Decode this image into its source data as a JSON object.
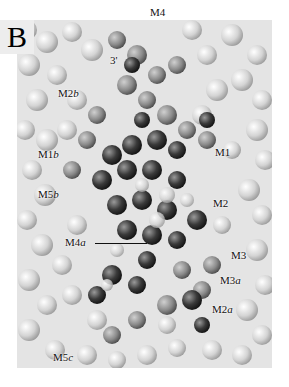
{
  "figure": {
    "panel_letter": "B",
    "colors": {
      "background_atoms": "#d8d8d8",
      "dark_atoms": "#3a3a3a",
      "mid_atoms": "#8a8a8a"
    },
    "labels": [
      {
        "id": "m4",
        "base": "M4",
        "suffix": "",
        "x": 150,
        "y": 6
      },
      {
        "id": "3p",
        "base": "3'",
        "suffix": "",
        "x": 110,
        "y": 54
      },
      {
        "id": "m2b",
        "base": "M2",
        "suffix": "b",
        "x": 58,
        "y": 87
      },
      {
        "id": "m1b",
        "base": "M1",
        "suffix": "b",
        "x": 38,
        "y": 148
      },
      {
        "id": "m1",
        "base": "M1",
        "suffix": "",
        "x": 215,
        "y": 146
      },
      {
        "id": "m5b",
        "base": "M5",
        "suffix": "b",
        "x": 38,
        "y": 188
      },
      {
        "id": "m2",
        "base": "M2",
        "suffix": "",
        "x": 213,
        "y": 197
      },
      {
        "id": "m4a",
        "base": "M4",
        "suffix": "a",
        "x": 65,
        "y": 236
      },
      {
        "id": "m3",
        "base": "M3",
        "suffix": "",
        "x": 231,
        "y": 249
      },
      {
        "id": "m3a",
        "base": "M3",
        "suffix": "a",
        "x": 220,
        "y": 274
      },
      {
        "id": "m2a",
        "base": "M2",
        "suffix": "a",
        "x": 212,
        "y": 303
      },
      {
        "id": "m5c",
        "base": "M5",
        "suffix": "c",
        "x": 53,
        "y": 351
      }
    ]
  }
}
